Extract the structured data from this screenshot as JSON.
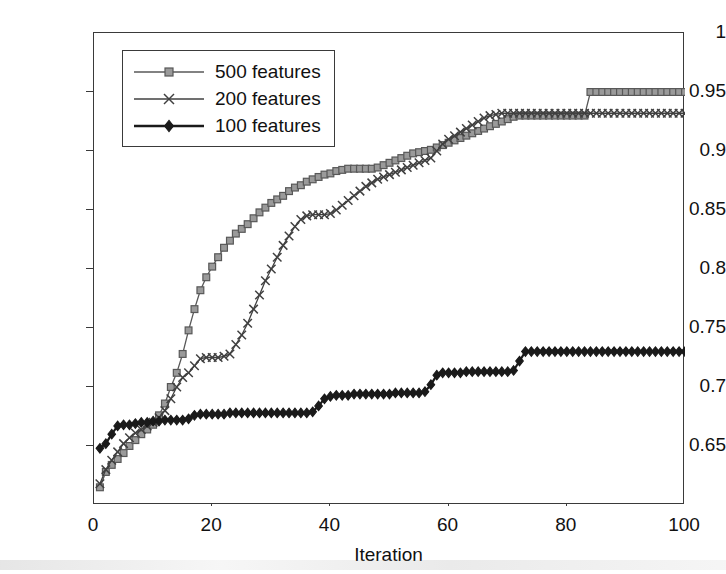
{
  "figure": {
    "background": "#ffffff",
    "axis_color": "#3a3a3a"
  },
  "axes": {
    "x": {
      "label": "Iteration",
      "min": 0,
      "max": 100,
      "ticks": [
        0,
        20,
        40,
        60,
        80,
        100
      ],
      "tick_labels": [
        "0",
        "20",
        "40",
        "60",
        "80",
        "100"
      ]
    },
    "y": {
      "label": "f(measure)",
      "min": 0.6,
      "max": 1.0,
      "ticks": [
        0.65,
        0.7,
        0.75,
        0.8,
        0.85,
        0.9,
        0.95,
        1.0
      ],
      "tick_labels": [
        "0.65",
        "0.7",
        "0.75",
        "0.8",
        "0.85",
        "0.9",
        "0.95",
        "1"
      ]
    }
  },
  "legend": {
    "position": "top-left-inside",
    "entries": [
      {
        "label": "500 features",
        "marker": "square",
        "color": "#585858",
        "fill": "#9a9a9a"
      },
      {
        "label": "200 features",
        "marker": "x",
        "color": "#404040",
        "fill": "none"
      },
      {
        "label": "100 features",
        "marker": "diamond",
        "color": "#1a1a1a",
        "fill": "#1a1a1a"
      }
    ]
  },
  "chart_data": {
    "type": "line",
    "title": "",
    "xlabel": "Iteration",
    "ylabel": "f(measure)",
    "xlim": [
      0,
      100
    ],
    "ylim": [
      0.6,
      1.0
    ],
    "grid": false,
    "legend_position": "upper left",
    "x": [
      1,
      2,
      3,
      4,
      5,
      6,
      7,
      8,
      9,
      10,
      11,
      12,
      13,
      14,
      15,
      16,
      17,
      18,
      19,
      20,
      21,
      22,
      23,
      24,
      25,
      26,
      27,
      28,
      29,
      30,
      31,
      32,
      33,
      34,
      35,
      36,
      37,
      38,
      39,
      40,
      41,
      42,
      43,
      44,
      45,
      46,
      47,
      48,
      49,
      50,
      51,
      52,
      53,
      54,
      55,
      56,
      57,
      58,
      59,
      60,
      61,
      62,
      63,
      64,
      65,
      66,
      67,
      68,
      69,
      70,
      71,
      72,
      73,
      74,
      75,
      76,
      77,
      78,
      79,
      80,
      81,
      82,
      83,
      84,
      85,
      86,
      87,
      88,
      89,
      90,
      91,
      92,
      93,
      94,
      95,
      96,
      97,
      98,
      99,
      100
    ],
    "series": [
      {
        "name": "500 features",
        "marker": "square",
        "color": "#585858",
        "fill": "#9a9a9a",
        "values": [
          0.615,
          0.628,
          0.634,
          0.639,
          0.644,
          0.65,
          0.655,
          0.66,
          0.664,
          0.668,
          0.676,
          0.686,
          0.7,
          0.712,
          0.728,
          0.748,
          0.766,
          0.782,
          0.793,
          0.802,
          0.81,
          0.818,
          0.824,
          0.83,
          0.834,
          0.838,
          0.843,
          0.848,
          0.852,
          0.856,
          0.859,
          0.862,
          0.866,
          0.869,
          0.871,
          0.874,
          0.876,
          0.878,
          0.88,
          0.881,
          0.883,
          0.884,
          0.885,
          0.885,
          0.885,
          0.885,
          0.885,
          0.886,
          0.888,
          0.89,
          0.892,
          0.894,
          0.896,
          0.898,
          0.899,
          0.9,
          0.901,
          0.903,
          0.905,
          0.907,
          0.909,
          0.911,
          0.913,
          0.915,
          0.917,
          0.919,
          0.921,
          0.923,
          0.925,
          0.927,
          0.929,
          0.93,
          0.93,
          0.93,
          0.93,
          0.93,
          0.93,
          0.93,
          0.93,
          0.93,
          0.93,
          0.93,
          0.93,
          0.95,
          0.95,
          0.95,
          0.95,
          0.95,
          0.95,
          0.95,
          0.95,
          0.95,
          0.95,
          0.95,
          0.95,
          0.95,
          0.95,
          0.95,
          0.95,
          0.95
        ]
      },
      {
        "name": "200 features",
        "marker": "x",
        "color": "#404040",
        "fill": "none",
        "values": [
          0.618,
          0.63,
          0.638,
          0.645,
          0.652,
          0.657,
          0.661,
          0.664,
          0.667,
          0.67,
          0.674,
          0.68,
          0.69,
          0.7,
          0.708,
          0.712,
          0.718,
          0.724,
          0.725,
          0.725,
          0.725,
          0.726,
          0.728,
          0.736,
          0.744,
          0.754,
          0.766,
          0.778,
          0.79,
          0.8,
          0.81,
          0.82,
          0.828,
          0.836,
          0.842,
          0.845,
          0.846,
          0.846,
          0.846,
          0.847,
          0.85,
          0.854,
          0.858,
          0.862,
          0.866,
          0.87,
          0.873,
          0.876,
          0.878,
          0.88,
          0.882,
          0.884,
          0.886,
          0.888,
          0.89,
          0.892,
          0.894,
          0.9,
          0.906,
          0.91,
          0.913,
          0.916,
          0.919,
          0.922,
          0.925,
          0.928,
          0.93,
          0.931,
          0.932,
          0.932,
          0.932,
          0.932,
          0.932,
          0.932,
          0.932,
          0.932,
          0.932,
          0.932,
          0.932,
          0.932,
          0.932,
          0.932,
          0.932,
          0.932,
          0.932,
          0.932,
          0.932,
          0.932,
          0.932,
          0.932,
          0.932,
          0.932,
          0.932,
          0.932,
          0.932,
          0.932,
          0.932,
          0.932,
          0.932,
          0.932
        ]
      },
      {
        "name": "100 features",
        "marker": "diamond",
        "color": "#1a1a1a",
        "fill": "#1a1a1a",
        "values": [
          0.648,
          0.652,
          0.66,
          0.667,
          0.668,
          0.668,
          0.669,
          0.67,
          0.67,
          0.671,
          0.671,
          0.672,
          0.672,
          0.672,
          0.672,
          0.673,
          0.676,
          0.677,
          0.677,
          0.677,
          0.677,
          0.677,
          0.678,
          0.678,
          0.678,
          0.678,
          0.678,
          0.678,
          0.678,
          0.678,
          0.678,
          0.678,
          0.678,
          0.678,
          0.678,
          0.678,
          0.679,
          0.684,
          0.69,
          0.692,
          0.693,
          0.693,
          0.693,
          0.694,
          0.694,
          0.694,
          0.694,
          0.694,
          0.694,
          0.694,
          0.695,
          0.695,
          0.695,
          0.695,
          0.695,
          0.696,
          0.702,
          0.71,
          0.712,
          0.712,
          0.712,
          0.712,
          0.713,
          0.713,
          0.713,
          0.713,
          0.713,
          0.713,
          0.713,
          0.713,
          0.714,
          0.722,
          0.73,
          0.73,
          0.73,
          0.73,
          0.73,
          0.73,
          0.73,
          0.73,
          0.73,
          0.73,
          0.73,
          0.73,
          0.73,
          0.73,
          0.73,
          0.73,
          0.73,
          0.73,
          0.73,
          0.73,
          0.73,
          0.73,
          0.73,
          0.73,
          0.73,
          0.73,
          0.73,
          0.73
        ]
      }
    ]
  }
}
